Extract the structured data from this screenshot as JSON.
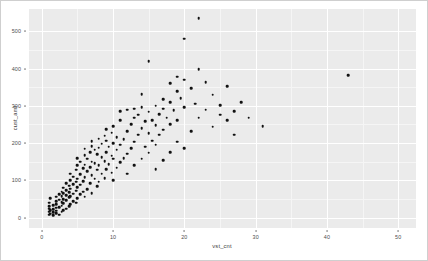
{
  "figure": {
    "width": 428,
    "height": 261,
    "panel_background": "#ebebeb",
    "gridline_color": "#ffffff",
    "point_color": "#111111",
    "border_color": "#cfcfcf"
  },
  "chart_data": {
    "type": "scatter",
    "title": "",
    "subtitle": "",
    "xlabel": "vst_cnt",
    "ylabel": "cust_amt",
    "xlim": [
      -1.8,
      52.5
    ],
    "ylim": [
      -28,
      560
    ],
    "xticks": [
      0,
      10,
      20,
      30,
      40,
      50
    ],
    "xtick_labels": [
      "0",
      "10",
      "20",
      "30",
      "40",
      "50"
    ],
    "yticks": [
      0,
      100,
      200,
      300,
      400,
      500
    ],
    "ytick_labels": [
      "0",
      "100",
      "200",
      "300",
      "400",
      "500"
    ],
    "grid": true,
    "grid_major": true,
    "grid_minor": true,
    "legend": false,
    "legend_position": "none",
    "marker": "filled-circle",
    "marker_size": 2.6,
    "series": [
      {
        "name": "observations",
        "points": [
          [
            1.0,
            8
          ],
          [
            1.0,
            16
          ],
          [
            1.0,
            24
          ],
          [
            1.0,
            30
          ],
          [
            1.0,
            40
          ],
          [
            1.2,
            10
          ],
          [
            1.2,
            20
          ],
          [
            1.2,
            52
          ],
          [
            1.6,
            6
          ],
          [
            1.6,
            14
          ],
          [
            1.6,
            22
          ],
          [
            1.6,
            34
          ],
          [
            2.0,
            12
          ],
          [
            2.0,
            18
          ],
          [
            2.0,
            26
          ],
          [
            2.0,
            36
          ],
          [
            2.0,
            44
          ],
          [
            2.0,
            56
          ],
          [
            2.4,
            8
          ],
          [
            2.4,
            28
          ],
          [
            2.4,
            48
          ],
          [
            2.4,
            62
          ],
          [
            2.8,
            16
          ],
          [
            2.8,
            32
          ],
          [
            2.8,
            42
          ],
          [
            2.8,
            58
          ],
          [
            2.8,
            70
          ],
          [
            3.0,
            20
          ],
          [
            3.0,
            38
          ],
          [
            3.0,
            50
          ],
          [
            3.0,
            66
          ],
          [
            3.0,
            80
          ],
          [
            3.4,
            24
          ],
          [
            3.4,
            46
          ],
          [
            3.4,
            60
          ],
          [
            3.4,
            74
          ],
          [
            3.4,
            92
          ],
          [
            3.8,
            30
          ],
          [
            3.8,
            54
          ],
          [
            3.8,
            68
          ],
          [
            3.8,
            86
          ],
          [
            4.0,
            36
          ],
          [
            4.0,
            58
          ],
          [
            4.0,
            78
          ],
          [
            4.0,
            100
          ],
          [
            4.0,
            118
          ],
          [
            4.4,
            44
          ],
          [
            4.4,
            64
          ],
          [
            4.4,
            90
          ],
          [
            4.4,
            110
          ],
          [
            4.8,
            40
          ],
          [
            4.8,
            72
          ],
          [
            4.8,
            96
          ],
          [
            4.8,
            128
          ],
          [
            5.0,
            52
          ],
          [
            5.0,
            82
          ],
          [
            5.0,
            104
          ],
          [
            5.0,
            140
          ],
          [
            5.0,
            160
          ],
          [
            5.4,
            62
          ],
          [
            5.4,
            88
          ],
          [
            5.4,
            116
          ],
          [
            5.4,
            150
          ],
          [
            5.8,
            70
          ],
          [
            5.8,
            98
          ],
          [
            5.8,
            132
          ],
          [
            6.0,
            56
          ],
          [
            6.0,
            108
          ],
          [
            6.0,
            142
          ],
          [
            6.0,
            168
          ],
          [
            6.0,
            185
          ],
          [
            6.4,
            76
          ],
          [
            6.4,
            124
          ],
          [
            6.4,
            158
          ],
          [
            6.8,
            92
          ],
          [
            6.8,
            136
          ],
          [
            6.8,
            176
          ],
          [
            7.0,
            66
          ],
          [
            7.0,
            114
          ],
          [
            7.0,
            150
          ],
          [
            7.0,
            192
          ],
          [
            7.0,
            205
          ],
          [
            7.4,
            104
          ],
          [
            7.4,
            146
          ],
          [
            7.4,
            182
          ],
          [
            7.8,
            84
          ],
          [
            7.8,
            128
          ],
          [
            7.8,
            170
          ],
          [
            8.0,
            96
          ],
          [
            8.0,
            140
          ],
          [
            8.0,
            188
          ],
          [
            8.0,
            212
          ],
          [
            8.4,
            118
          ],
          [
            8.4,
            162
          ],
          [
            8.4,
            198
          ],
          [
            8.8,
            106
          ],
          [
            8.8,
            152
          ],
          [
            8.8,
            220
          ],
          [
            9.0,
            130
          ],
          [
            9.0,
            176
          ],
          [
            9.0,
            206
          ],
          [
            9.0,
            238
          ],
          [
            9.4,
            144
          ],
          [
            9.4,
            190
          ],
          [
            9.8,
            120
          ],
          [
            9.8,
            166
          ],
          [
            9.8,
            228
          ],
          [
            10.0,
            100
          ],
          [
            10.0,
            158
          ],
          [
            10.0,
            200
          ],
          [
            10.0,
            246
          ],
          [
            10.5,
            134
          ],
          [
            10.5,
            182
          ],
          [
            10.5,
            216
          ],
          [
            11.0,
            148
          ],
          [
            11.0,
            196
          ],
          [
            11.0,
            262
          ],
          [
            11.0,
            286
          ],
          [
            11.5,
            160
          ],
          [
            11.5,
            210
          ],
          [
            12.0,
            118
          ],
          [
            12.0,
            172
          ],
          [
            12.0,
            232
          ],
          [
            12.0,
            290
          ],
          [
            12.5,
            186
          ],
          [
            12.5,
            250
          ],
          [
            13.0,
            140
          ],
          [
            13.0,
            204
          ],
          [
            13.0,
            268
          ],
          [
            13.0,
            292
          ],
          [
            13.5,
            222
          ],
          [
            13.5,
            276
          ],
          [
            14.0,
            158
          ],
          [
            14.0,
            240
          ],
          [
            14.0,
            296
          ],
          [
            14.0,
            332
          ],
          [
            14.5,
            190
          ],
          [
            14.5,
            258
          ],
          [
            15.0,
            174
          ],
          [
            15.0,
            226
          ],
          [
            15.0,
            284
          ],
          [
            15.0,
            420
          ],
          [
            15.5,
            206
          ],
          [
            15.5,
            262
          ],
          [
            16.0,
            130
          ],
          [
            16.0,
            196
          ],
          [
            16.0,
            248
          ],
          [
            16.0,
            300
          ],
          [
            16.5,
            222
          ],
          [
            16.5,
            278
          ],
          [
            17.0,
            154
          ],
          [
            17.0,
            236
          ],
          [
            17.0,
            292
          ],
          [
            17.0,
            318
          ],
          [
            17.5,
            268
          ],
          [
            18.0,
            176
          ],
          [
            18.0,
            250
          ],
          [
            18.0,
            310
          ],
          [
            18.0,
            360
          ],
          [
            18.5,
            288
          ],
          [
            19.0,
            204
          ],
          [
            19.0,
            262
          ],
          [
            19.0,
            340
          ],
          [
            19.0,
            378
          ],
          [
            19.5,
            320
          ],
          [
            20.0,
            186
          ],
          [
            20.0,
            296
          ],
          [
            20.0,
            370
          ],
          [
            20.0,
            480
          ],
          [
            21.0,
            232
          ],
          [
            21.0,
            348
          ],
          [
            21.5,
            306
          ],
          [
            22.0,
            268
          ],
          [
            22.0,
            398
          ],
          [
            22.0,
            536
          ],
          [
            23.0,
            290
          ],
          [
            23.0,
            364
          ],
          [
            24.0,
            244
          ],
          [
            24.0,
            330
          ],
          [
            25.0,
            276
          ],
          [
            25.0,
            302
          ],
          [
            26.0,
            262
          ],
          [
            26.0,
            352
          ],
          [
            27.0,
            222
          ],
          [
            27.0,
            286
          ],
          [
            28.0,
            310
          ],
          [
            29.0,
            268
          ],
          [
            31.0,
            246
          ],
          [
            43.0,
            382
          ]
        ]
      }
    ]
  },
  "axes": {
    "x_title": "vst_cnt",
    "y_title": "cust_amt"
  }
}
